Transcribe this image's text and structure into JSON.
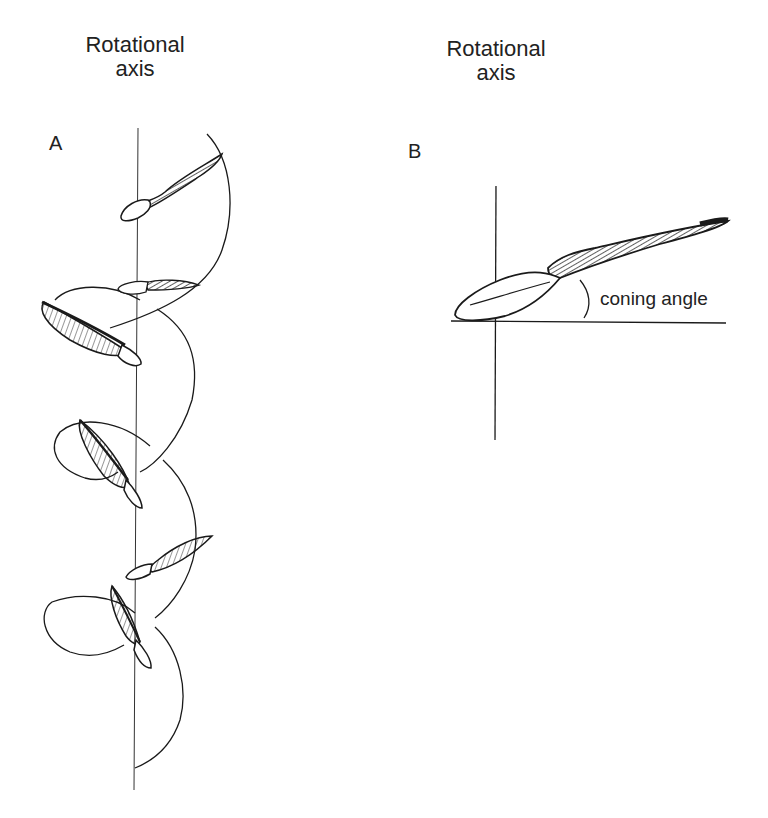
{
  "figure": {
    "panel_a": {
      "label": "A",
      "title_line1": "Rotational",
      "title_line2": "axis",
      "description": "Samara seed descending along a helical path around a vertical rotational axis"
    },
    "panel_b": {
      "label": "B",
      "title_line1": "Rotational",
      "title_line2": "axis",
      "angle_label": "coning angle"
    },
    "colors": {
      "ink": "#1a1a1a",
      "background": "#ffffff"
    }
  }
}
